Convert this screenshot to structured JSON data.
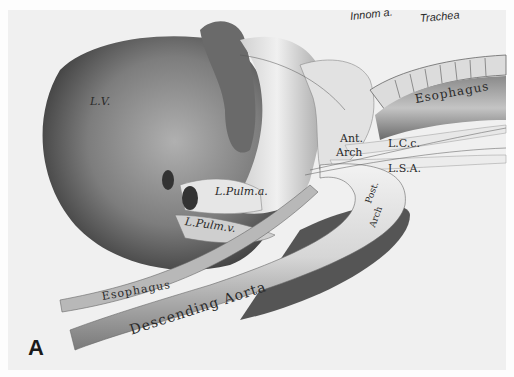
{
  "figure": {
    "panel_letter": "A",
    "colors": {
      "background": "#f0f0f0",
      "heart": "#7a7a7a",
      "vessel": "#d8d8d8",
      "shadow": "#3a3a3a"
    }
  },
  "labels": {
    "innom": "Innom a.",
    "trachea": "Trachea",
    "esophagus_upper": "Esophagus",
    "lv": "L.V.",
    "ant_arch_1": "Ant.",
    "ant_arch_2": "Arch",
    "lcc": "L.C.c.",
    "lsa": "L.S.A.",
    "lpulm_a": "L.Pulm.a.",
    "lpulm_v": "L.Pulm.v.",
    "post_arch_1": "Post.",
    "post_arch_2": "Arch",
    "esophagus_lower": "Esophagus",
    "descending_aorta": "Descending Aorta"
  }
}
